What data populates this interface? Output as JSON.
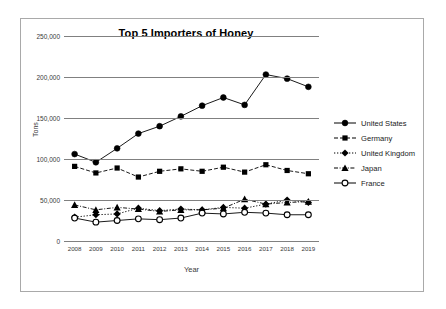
{
  "chart_data": {
    "type": "line",
    "title": "Top 5 Importers of Honey",
    "xlabel": "Year",
    "ylabel": "Tons",
    "x": [
      2008,
      2009,
      2010,
      2011,
      2012,
      2013,
      2014,
      2015,
      2016,
      2017,
      2018,
      2019
    ],
    "categories": [
      "2008",
      "2009",
      "2010",
      "2011",
      "2012",
      "2013",
      "2014",
      "2015",
      "2016",
      "2017",
      "2018",
      "2019"
    ],
    "ylim": [
      0,
      250000
    ],
    "ytick_values": [
      0,
      50000,
      100000,
      150000,
      200000,
      250000
    ],
    "ytick_labels": [
      "0",
      "50,000",
      "100,000",
      "150,000",
      "200,000",
      "250,000"
    ],
    "grid": true,
    "legend_position": "right",
    "series": [
      {
        "name": "United States",
        "marker": "filled-circle",
        "line": "solid",
        "color": "#000000",
        "values": [
          106000,
          96000,
          113000,
          131000,
          140000,
          152000,
          165000,
          175000,
          166000,
          203000,
          198000,
          188000
        ]
      },
      {
        "name": "Germany",
        "marker": "filled-square",
        "line": "dashed",
        "color": "#000000",
        "values": [
          91000,
          83000,
          89000,
          78000,
          85000,
          88000,
          85000,
          90000,
          84000,
          93000,
          86000,
          82000
        ]
      },
      {
        "name": "United Kingdom",
        "marker": "filled-diamond",
        "line": "dotted",
        "color": "#000000",
        "values": [
          29000,
          32000,
          33000,
          40000,
          37000,
          39000,
          38000,
          41000,
          40000,
          45000,
          50000,
          47000
        ]
      },
      {
        "name": "Japan",
        "marker": "filled-triangle",
        "line": "dash-dot",
        "color": "#000000",
        "values": [
          44000,
          38000,
          41000,
          39000,
          36000,
          38000,
          38000,
          40000,
          51000,
          45000,
          47000,
          48000
        ]
      },
      {
        "name": "France",
        "marker": "open-circle",
        "line": "solid",
        "color": "#000000",
        "values": [
          28000,
          23000,
          25000,
          27000,
          26000,
          28000,
          34000,
          33000,
          35000,
          34000,
          32000,
          32000
        ]
      }
    ]
  },
  "axes": {
    "y_title": "Tons",
    "x_title": "Year"
  },
  "legend": {
    "items": [
      {
        "label": "United States"
      },
      {
        "label": "Germany"
      },
      {
        "label": "United Kingdom"
      },
      {
        "label": "Japan"
      },
      {
        "label": "France"
      }
    ]
  }
}
